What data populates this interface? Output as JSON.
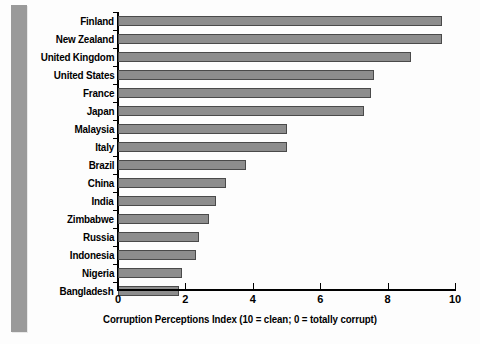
{
  "chart_data": {
    "type": "bar",
    "orientation": "horizontal",
    "title": "",
    "subtitle": "",
    "xlabel": "Corruption Perceptions Index (10 = clean; 0 = totally corrupt)",
    "ylabel": "",
    "xlim": [
      0,
      10
    ],
    "xticks": [
      0,
      2,
      4,
      6,
      8,
      10
    ],
    "xtick_labels": [
      "0",
      "2",
      "4",
      "6",
      "8",
      "10"
    ],
    "grid": false,
    "legend": null,
    "categories": [
      "Finland",
      "New Zealand",
      "United Kingdom",
      "United States",
      "France",
      "Japan",
      "Malaysia",
      "Italy",
      "Brazil",
      "China",
      "India",
      "Zimbabwe",
      "Russia",
      "Indonesia",
      "Nigeria",
      "Bangladesh"
    ],
    "values": [
      9.6,
      9.6,
      8.7,
      7.6,
      7.5,
      7.3,
      5.0,
      5.0,
      3.8,
      3.2,
      2.9,
      2.7,
      2.4,
      2.3,
      1.9,
      1.8
    ],
    "bar_color": "#8d8d8d",
    "bar_border_color": "#4a4a4a",
    "background_color": "#fdfdfd",
    "accent_band_color": "#9a9a9a"
  }
}
